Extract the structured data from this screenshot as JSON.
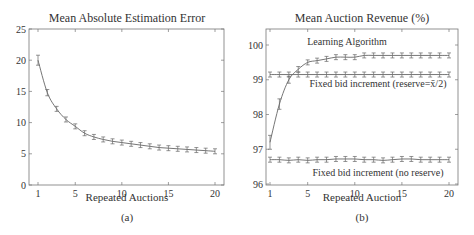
{
  "chart_data": [
    {
      "type": "line",
      "title": "Mean Absolute Estimation Error",
      "xlabel": "Repeated Auctions",
      "ylabel": "",
      "caption": "(a)",
      "xlim": [
        0.3,
        21
      ],
      "ylim": [
        0,
        25
      ],
      "xticks": [
        1,
        5,
        10,
        15,
        20
      ],
      "yticks": [
        0,
        5,
        10,
        15,
        20,
        25
      ],
      "grid": false,
      "x": [
        1,
        2,
        3,
        4,
        5,
        6,
        7,
        8,
        9,
        10,
        11,
        12,
        13,
        14,
        15,
        16,
        17,
        18,
        19,
        20
      ],
      "series": [
        {
          "name": "Estimation Error",
          "values": [
            20.0,
            14.8,
            12.2,
            10.5,
            9.4,
            8.3,
            7.7,
            7.3,
            7.0,
            6.8,
            6.6,
            6.4,
            6.2,
            6.0,
            5.9,
            5.8,
            5.7,
            5.6,
            5.5,
            5.4
          ],
          "error": [
            0.8,
            0.5,
            0.4,
            0.3,
            0.25,
            0.2,
            0.2,
            0.15,
            0.15,
            0.15,
            0.15,
            0.15,
            0.15,
            0.15,
            0.15,
            0.15,
            0.15,
            0.15,
            0.15,
            0.15
          ]
        }
      ]
    },
    {
      "type": "line",
      "title": "Mean Auction Revenue (%)",
      "xlabel": "Repeated Auction",
      "ylabel": "",
      "caption": "(b)",
      "xlim": [
        0.7,
        21
      ],
      "ylim": [
        96,
        100.4
      ],
      "xticks": [
        1,
        5,
        10,
        15,
        20
      ],
      "yticks": [
        96,
        97,
        98,
        99,
        100
      ],
      "grid": false,
      "x": [
        1,
        2,
        3,
        4,
        5,
        6,
        7,
        8,
        9,
        10,
        11,
        12,
        13,
        14,
        15,
        16,
        17,
        18,
        19,
        20
      ],
      "series": [
        {
          "name": "Learning Algorithm",
          "values": [
            97.2,
            98.3,
            99.0,
            99.3,
            99.5,
            99.55,
            99.6,
            99.65,
            99.65,
            99.65,
            99.7,
            99.7,
            99.7,
            99.7,
            99.7,
            99.7,
            99.7,
            99.7,
            99.7,
            99.7
          ],
          "error": [
            0.2,
            0.15,
            0.1,
            0.08,
            0.07,
            0.06,
            0.06,
            0.06,
            0.06,
            0.06,
            0.06,
            0.06,
            0.06,
            0.06,
            0.06,
            0.06,
            0.06,
            0.06,
            0.06,
            0.06
          ]
        },
        {
          "name": "Fixed bid increment (reserve=x̄/2)",
          "values": [
            99.15,
            99.15,
            99.15,
            99.15,
            99.15,
            99.15,
            99.15,
            99.15,
            99.15,
            99.15,
            99.15,
            99.15,
            99.15,
            99.15,
            99.15,
            99.15,
            99.15,
            99.15,
            99.15,
            99.15
          ],
          "error": [
            0.03,
            0.03,
            0.03,
            0.03,
            0.03,
            0.03,
            0.03,
            0.03,
            0.03,
            0.03,
            0.03,
            0.03,
            0.03,
            0.03,
            0.03,
            0.03,
            0.03,
            0.03,
            0.03,
            0.03
          ]
        },
        {
          "name": "Fixed bid increment (no reserve)",
          "values": [
            96.7,
            96.7,
            96.68,
            96.7,
            96.68,
            96.7,
            96.7,
            96.72,
            96.72,
            96.72,
            96.7,
            96.7,
            96.68,
            96.7,
            96.72,
            96.72,
            96.7,
            96.7,
            96.7,
            96.7
          ],
          "error": [
            0.05,
            0.05,
            0.05,
            0.05,
            0.05,
            0.05,
            0.05,
            0.05,
            0.05,
            0.05,
            0.05,
            0.05,
            0.05,
            0.05,
            0.05,
            0.05,
            0.05,
            0.05,
            0.05,
            0.05
          ]
        }
      ],
      "annotations": [
        "Learning Algorithm",
        "Fixed bid increment (reserve=x̄/2)",
        "Fixed bid increment (no reserve)"
      ]
    }
  ],
  "panels": {
    "a": {
      "title": "Mean Absolute Estimation Error",
      "xlabel": "Repeated Auctions",
      "caption": "(a)"
    },
    "b": {
      "title": "Mean Auction Revenue (%)",
      "xlabel": "Repeated Auction",
      "caption": "(b)",
      "label_learning": "Learning Algorithm",
      "label_reserve": "Fixed bid increment (reserve=x̄/2)",
      "label_noreserve": "Fixed bid increment (no reserve)"
    }
  }
}
